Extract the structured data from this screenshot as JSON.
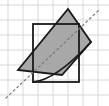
{
  "figure": {
    "canvas": {
      "width": 109,
      "height": 106
    },
    "background_color": "#ffffff",
    "grid": {
      "visible": true,
      "line_color": "#d8d8d8",
      "line_width": 1,
      "spacing": 15,
      "x_lines": [
        8,
        23,
        38,
        53,
        68,
        83,
        98
      ],
      "y_lines": [
        5,
        20,
        35,
        50,
        65,
        80,
        95
      ]
    },
    "axis_line": {
      "label": "dashed-diagonal-axis",
      "style": "dashed",
      "color": "#7a7a7a",
      "width": 1.2,
      "dash_pattern": "2 3",
      "from": {
        "x": 6,
        "y": 98
      },
      "to": {
        "x": 99,
        "y": 10
      }
    },
    "shapes": [
      {
        "name": "rotated-square",
        "type": "polygon",
        "fill": "#a8a8a8",
        "fill_opacity": 1,
        "stroke": "#1a1a1a",
        "stroke_width": 1.8,
        "points": [
          {
            "x": 68,
            "y": 9
          },
          {
            "x": 91,
            "y": 42
          },
          {
            "x": 62,
            "y": 75
          },
          {
            "x": 18,
            "y": 70
          }
        ]
      },
      {
        "name": "axis-aligned-rectangle",
        "type": "rect",
        "fill": "none",
        "stroke": "#1a1a1a",
        "stroke_width": 1.8,
        "x": 33,
        "y": 24,
        "width": 46,
        "height": 58
      },
      {
        "name": "curved-arc-edge",
        "type": "path",
        "fill": "none",
        "stroke": "#1a1a1a",
        "stroke_width": 1.8,
        "d": "M 33 82 Q 56 80 91 42"
      }
    ],
    "labels": []
  }
}
